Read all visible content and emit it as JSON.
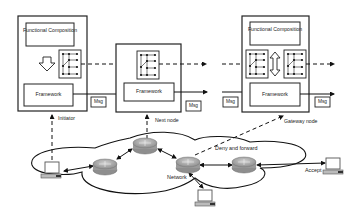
{
  "diagram": {
    "nodes": [
      {
        "id": "initiator",
        "label": "Initiator",
        "functional_composition": "Functional Composition",
        "framework": "Framework",
        "msg_out": "Msg"
      },
      {
        "id": "next-node",
        "label": "Next node",
        "framework": "Framework",
        "msg_out": "Msg"
      },
      {
        "id": "gateway-node",
        "label": "Gateway node",
        "functional_composition": "Functional Composition",
        "framework": "Framework",
        "msg_in": "Msg",
        "msg_out": "Msg"
      }
    ],
    "network": {
      "network_label": "Network",
      "deny_label": "Deny and forward",
      "accept_label": "Accept"
    },
    "colors": {
      "line": "#111111",
      "router_fill": "#9a9a9a",
      "router_top": "#c4c4c4",
      "box_stroke": "#222222"
    }
  }
}
